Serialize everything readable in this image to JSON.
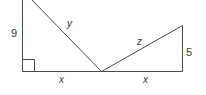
{
  "diagram": {
    "labels": {
      "left_leg": "9",
      "left_hypotenuse": "y",
      "right_hypotenuse": "z",
      "right_leg": "5",
      "left_base": "x",
      "right_base": "x"
    },
    "right_angle_marker": true,
    "colors": {
      "stroke": "#4a4a4a",
      "text": "#3a3a3a",
      "background": "#ffffff"
    }
  }
}
